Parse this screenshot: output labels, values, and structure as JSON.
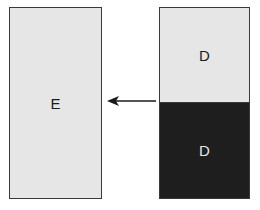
{
  "diagram": {
    "nodes": [
      {
        "id": "E",
        "label": "E",
        "fill": "#e6e6e6",
        "text_color": "#1a1a1a"
      },
      {
        "id": "D_top",
        "label": "D",
        "fill": "#e6e6e6",
        "text_color": "#1a1a1a"
      },
      {
        "id": "D_bottom",
        "label": "D",
        "fill": "#1e1e1e",
        "text_color": "#e6e6e6"
      }
    ],
    "edges": [
      {
        "from": "D_stack",
        "to": "E",
        "style": "arrow",
        "color": "#1a1a1a"
      }
    ]
  }
}
